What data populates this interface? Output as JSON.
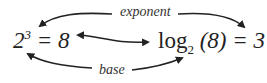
{
  "labels": {
    "top": "exponent",
    "bottom": "base"
  },
  "left_equation": {
    "base": "2",
    "exponent": "3",
    "rest": " = 8"
  },
  "right_equation": {
    "func": "log",
    "subscript": "2",
    "argument": " (8) = 3"
  },
  "colors": {
    "ink": "#222222"
  }
}
